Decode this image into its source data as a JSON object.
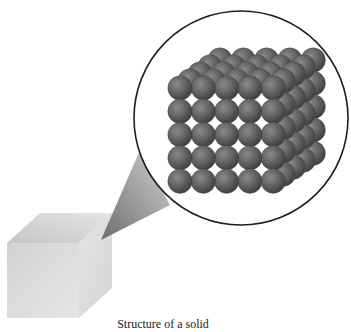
{
  "figure": {
    "caption": "Structure of a solid",
    "macro_object": "cube",
    "magnified_view": {
      "shape": "circle",
      "content": "simple cubic lattice of spheres",
      "grid": {
        "columns": 5,
        "rows": 5,
        "layers": 5
      }
    },
    "colors": {
      "sphere": "#5f5f5f",
      "sphere_highlight": "#8a8a8a",
      "sphere_shadow": "#3a3a3a",
      "circle_outline": "#1e1e1e",
      "cube_front": "#d9d9d9",
      "cube_top": "#cfcfcf",
      "cube_right": "#e2e2e2",
      "callout_dark": "#7a7a7a",
      "callout_light": "#c8c8c8"
    }
  }
}
